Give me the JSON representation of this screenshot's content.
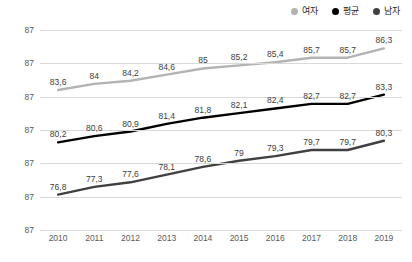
{
  "legend": {
    "position": "top-right",
    "items": [
      {
        "label": "여자",
        "color": "#b3b3b3",
        "marker": "legend-dot-icon"
      },
      {
        "label": "평균",
        "color": "#000000",
        "marker": "legend-dot-icon"
      },
      {
        "label": "남자",
        "color": "#404040",
        "marker": "legend-dot-icon"
      }
    ]
  },
  "yaxis": {
    "tick_labels": [
      "87",
      "87",
      "87",
      "87",
      "87",
      "87",
      "87"
    ]
  },
  "chart_data": {
    "type": "line",
    "title": "",
    "subtitle": "",
    "xlabel": "",
    "ylabel": "",
    "grid": true,
    "legend_position": "top-right",
    "categories": [
      "2010",
      "2011",
      "2012",
      "2013",
      "2014",
      "2015",
      "2016",
      "2017",
      "2018",
      "2019"
    ],
    "x": [
      2010,
      2011,
      2012,
      2013,
      2014,
      2015,
      2016,
      2017,
      2018,
      2019
    ],
    "ylim": [
      74.5,
      87.5
    ],
    "yticks": [
      87,
      87,
      87,
      87,
      87,
      87,
      87
    ],
    "series": [
      {
        "name": "여자",
        "color": "#b3b3b3",
        "values": [
          83.6,
          84,
          84.2,
          84.6,
          85,
          85.2,
          85.4,
          85.7,
          85.7,
          86.3
        ],
        "labels": [
          "83,6",
          "84",
          "84,2",
          "84,6",
          "85",
          "85,2",
          "85,4",
          "85,7",
          "85,7",
          "86,3"
        ]
      },
      {
        "name": "평균",
        "color": "#000000",
        "values": [
          80.2,
          80.6,
          80.9,
          81.4,
          81.8,
          82.1,
          82.4,
          82.7,
          82.7,
          83.3
        ],
        "labels": [
          "80,2",
          "80,6",
          "80,9",
          "81,4",
          "81,8",
          "82,1",
          "82,4",
          "82,7",
          "82,7",
          "83,3"
        ]
      },
      {
        "name": "남자",
        "color": "#404040",
        "values": [
          76.8,
          77.3,
          77.6,
          78.1,
          78.6,
          79,
          79.3,
          79.7,
          79.7,
          80.3
        ],
        "labels": [
          "76,8",
          "77,3",
          "77,6",
          "78,1",
          "78,6",
          "79",
          "79,3",
          "79,7",
          "79,7",
          "80,3"
        ]
      }
    ]
  }
}
